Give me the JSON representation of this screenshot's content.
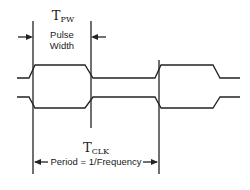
{
  "diagram": {
    "type": "timing-diagram",
    "pulse_width": {
      "symbol": "T",
      "subscript": "PW",
      "label_line1": "Pulse",
      "label_line2": "Width"
    },
    "period": {
      "symbol": "T",
      "subscript": "CLK",
      "label": "Period = 1/Frequency"
    },
    "signals": [
      "upper-waveform",
      "lower-waveform (complement)"
    ],
    "colors": {
      "line": "#222222",
      "background": "#ffffff"
    }
  }
}
